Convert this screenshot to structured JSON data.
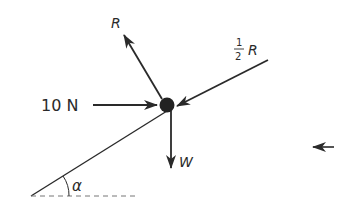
{
  "diagram": {
    "type": "force-diagram",
    "colors": {
      "ink": "#2a2a2a",
      "particle": "#222222",
      "dashed": "#777777",
      "background": "#ffffff"
    },
    "particle": {
      "label": ""
    },
    "forces": [
      {
        "id": "R",
        "label": "R",
        "direction": "up-left (normal to incline)"
      },
      {
        "id": "half_R",
        "label_num": "1",
        "label_den": "2",
        "label_var": "R",
        "direction": "down-left along incline"
      },
      {
        "id": "push",
        "label": "10 N",
        "direction": "horizontal right"
      },
      {
        "id": "W",
        "label": "W",
        "direction": "vertically down"
      }
    ],
    "angle": {
      "label": "α"
    },
    "side_arrow": {
      "direction": "left"
    }
  }
}
